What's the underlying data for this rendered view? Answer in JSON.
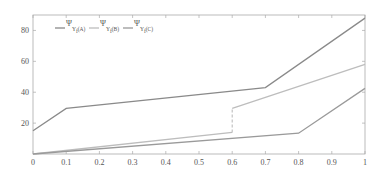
{
  "chart_data": {
    "type": "line",
    "title": "",
    "xlabel": "",
    "ylabel": "",
    "xlim": [
      0,
      1
    ],
    "ylim": [
      0,
      90
    ],
    "grid": false,
    "legend_position": "top-left (inside)",
    "x_ticks": [
      "0",
      "0.1",
      "0.2",
      "0.3",
      "0.4",
      "0.5",
      "0.6",
      "0.7",
      "0.8",
      "0.9",
      "1"
    ],
    "y_ticks": [
      "20",
      "40",
      "60",
      "80"
    ],
    "series": [
      {
        "name": "Ψ_Y_f(A)",
        "legend_main": "Ψ",
        "legend_sub": "Y",
        "legend_subsub": "f",
        "legend_suffix": "(A)",
        "color": "#8a8a8a",
        "x": [
          0,
          0.1,
          0.7,
          1
        ],
        "y": [
          15,
          29.5,
          43,
          88
        ]
      },
      {
        "name": "Ψ_Y_f(B)",
        "legend_main": "Ψ",
        "legend_sub": "Y",
        "legend_subsub": "f",
        "legend_suffix": "(B)",
        "color": "#bdbdbd",
        "x": [
          0,
          0.6,
          0.6,
          1
        ],
        "y": [
          0,
          14,
          29.5,
          58
        ],
        "discontinuity": {
          "x": 0.6,
          "from": 14,
          "to": 29.5,
          "style": "dashed"
        }
      },
      {
        "name": "Ψ_Y_f(C)",
        "legend_main": "Ψ",
        "legend_sub": "Y",
        "legend_subsub": "f",
        "legend_suffix": "(C)",
        "color": "#9a9a9a",
        "x": [
          0,
          0.8,
          1
        ],
        "y": [
          0,
          13.5,
          42.5
        ]
      }
    ]
  },
  "colors": {
    "axis": "#aaaaaa",
    "text": "#555555",
    "background": "#ffffff"
  }
}
